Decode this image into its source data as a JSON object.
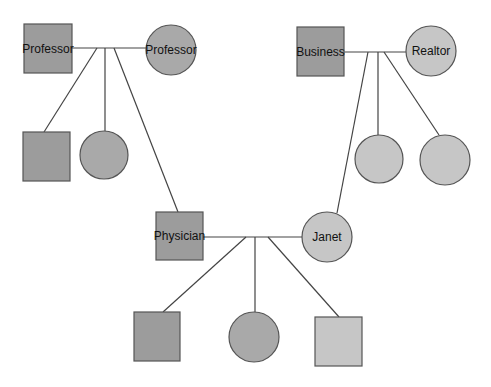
{
  "diagram": {
    "type": "genogram",
    "colors": {
      "male_fill": "#9c9c9c",
      "female_fill": "#a9a9a9",
      "light_fill": "#c6c6c6",
      "stroke": "#555555",
      "line": "#444444",
      "background": "#ffffff"
    },
    "nodes": [
      {
        "id": "pgf",
        "shape": "square",
        "label": "Professor",
        "x": 24,
        "y": 24,
        "w": 48,
        "h": 49,
        "fill": "male"
      },
      {
        "id": "pgm",
        "shape": "circle",
        "label": "Professor",
        "cx": 171,
        "cy": 50,
        "r": 25,
        "fill": "female"
      },
      {
        "id": "uncle1",
        "shape": "square",
        "label": "",
        "x": 23,
        "y": 132,
        "w": 47,
        "h": 49,
        "fill": "male"
      },
      {
        "id": "aunt1",
        "shape": "circle",
        "label": "",
        "cx": 104,
        "cy": 155,
        "r": 24,
        "fill": "female"
      },
      {
        "id": "mgf",
        "shape": "square",
        "label": "Business",
        "x": 297,
        "y": 27,
        "w": 47,
        "h": 49,
        "fill": "male"
      },
      {
        "id": "mgm",
        "shape": "circle",
        "label": "Realtor",
        "cx": 431,
        "cy": 51,
        "r": 25,
        "fill": "light"
      },
      {
        "id": "aunt2",
        "shape": "circle",
        "label": "",
        "cx": 379,
        "cy": 159,
        "r": 24,
        "fill": "light"
      },
      {
        "id": "aunt3",
        "shape": "circle",
        "label": "",
        "cx": 445,
        "cy": 160,
        "r": 25,
        "fill": "light"
      },
      {
        "id": "father",
        "shape": "square",
        "label": "Physician",
        "x": 156,
        "y": 212,
        "w": 47,
        "h": 48,
        "fill": "male"
      },
      {
        "id": "mother",
        "shape": "circle",
        "label": "Janet",
        "cx": 327,
        "cy": 237,
        "r": 25,
        "fill": "light"
      },
      {
        "id": "son1",
        "shape": "square",
        "label": "",
        "x": 134,
        "y": 312,
        "w": 46,
        "h": 49,
        "fill": "male"
      },
      {
        "id": "daughter",
        "shape": "circle",
        "label": "",
        "cx": 254,
        "cy": 337,
        "r": 25,
        "fill": "female"
      },
      {
        "id": "son2",
        "shape": "square",
        "label": "",
        "x": 315,
        "y": 317,
        "w": 47,
        "h": 49,
        "fill": "light"
      }
    ],
    "edges": [
      {
        "from": "pgf-pgm",
        "x1": 72,
        "y1": 48,
        "x2": 147,
        "y2": 48
      },
      {
        "from": "pgm-couple-to-uncle1",
        "x1": 97,
        "y1": 48,
        "x2": 44,
        "y2": 132
      },
      {
        "from": "pgm-couple-to-aunt1",
        "x1": 105,
        "y1": 48,
        "x2": 105,
        "y2": 131
      },
      {
        "from": "pgm-couple-to-father",
        "x1": 114,
        "y1": 48,
        "x2": 178,
        "y2": 212
      },
      {
        "from": "mgf-mgm",
        "x1": 344,
        "y1": 52,
        "x2": 406,
        "y2": 52
      },
      {
        "from": "mgm-couple-to-mother",
        "x1": 368,
        "y1": 52,
        "x2": 337,
        "y2": 213
      },
      {
        "from": "mgm-couple-to-aunt2",
        "x1": 378,
        "y1": 52,
        "x2": 378,
        "y2": 135
      },
      {
        "from": "mgm-couple-to-aunt3",
        "x1": 384,
        "y1": 52,
        "x2": 439,
        "y2": 135
      },
      {
        "from": "father-mother",
        "x1": 203,
        "y1": 237,
        "x2": 302,
        "y2": 237
      },
      {
        "from": "parents-to-son1",
        "x1": 246,
        "y1": 237,
        "x2": 163,
        "y2": 312
      },
      {
        "from": "parents-to-daughter",
        "x1": 255,
        "y1": 237,
        "x2": 255,
        "y2": 312
      },
      {
        "from": "parents-to-son2",
        "x1": 268,
        "y1": 237,
        "x2": 339,
        "y2": 317
      }
    ]
  }
}
